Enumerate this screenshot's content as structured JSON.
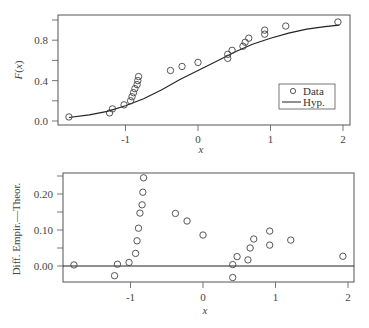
{
  "chart_data": [
    {
      "type": "scatter+line",
      "title": "",
      "xlabel": "x",
      "ylabel": "F(x)",
      "xlim": [
        -1.85,
        2.1
      ],
      "ylim": [
        -0.03,
        1.05
      ],
      "xticks": [
        -1,
        0,
        1,
        2
      ],
      "xtick_labels": [
        "-1",
        "0",
        "1",
        "2"
      ],
      "yticks": [
        0.0,
        0.2,
        0.4,
        0.6,
        0.8,
        1.0
      ],
      "ytick_labels": [
        "0.0",
        "",
        "0.4",
        "",
        "0.8",
        ""
      ],
      "grid": false,
      "legend": {
        "position": "lower right",
        "entries": [
          "Data",
          "Hyp."
        ]
      },
      "series": [
        {
          "name": "Data",
          "kind": "scatter",
          "marker": "open-circle",
          "x": [
            -1.78,
            -1.22,
            -1.18,
            -1.02,
            -0.93,
            -0.91,
            -0.89,
            -0.87,
            -0.84,
            -0.83,
            -0.82,
            -0.38,
            -0.22,
            0.0,
            0.41,
            0.41,
            0.47,
            0.62,
            0.65,
            0.7,
            0.92,
            0.92,
            1.21,
            1.93
          ],
          "y": [
            0.04,
            0.08,
            0.12,
            0.16,
            0.2,
            0.24,
            0.28,
            0.32,
            0.36,
            0.4,
            0.44,
            0.5,
            0.54,
            0.58,
            0.62,
            0.66,
            0.7,
            0.74,
            0.78,
            0.82,
            0.86,
            0.9,
            0.94,
            0.98
          ]
        },
        {
          "name": "Hyp.",
          "kind": "line",
          "x": [
            -1.78,
            -1.5,
            -1.25,
            -1.0,
            -0.75,
            -0.5,
            -0.25,
            0.0,
            0.25,
            0.5,
            0.75,
            1.0,
            1.25,
            1.5,
            1.75,
            1.95
          ],
          "y": [
            0.035,
            0.06,
            0.095,
            0.15,
            0.22,
            0.31,
            0.41,
            0.5,
            0.59,
            0.68,
            0.76,
            0.82,
            0.87,
            0.91,
            0.935,
            0.95
          ]
        }
      ]
    },
    {
      "type": "scatter",
      "title": "",
      "xlabel": "x",
      "ylabel": "Diff. Empir.—Theor.",
      "xlim": [
        -1.85,
        2.1
      ],
      "ylim": [
        -0.045,
        0.26
      ],
      "xticks": [
        -1,
        0,
        1,
        2
      ],
      "xtick_labels": [
        "-1",
        "0",
        "1",
        "2"
      ],
      "yticks": [
        0.0,
        0.05,
        0.1,
        0.15,
        0.2,
        0.25
      ],
      "ytick_labels": [
        "0.00",
        "",
        "0.10",
        "",
        "0.20",
        ""
      ],
      "grid": false,
      "reference_line": 0.0,
      "series": [
        {
          "name": "Difference",
          "marker": "open-circle",
          "x": [
            -1.78,
            -1.22,
            -1.18,
            -1.02,
            -0.93,
            -0.91,
            -0.89,
            -0.87,
            -0.84,
            -0.83,
            -0.82,
            -0.38,
            -0.22,
            0.0,
            0.41,
            0.41,
            0.47,
            0.62,
            0.65,
            0.7,
            0.92,
            0.92,
            1.21,
            1.93
          ],
          "y": [
            0.003,
            -0.027,
            0.005,
            0.01,
            0.035,
            0.07,
            0.105,
            0.147,
            0.17,
            0.205,
            0.245,
            0.146,
            0.125,
            0.086,
            -0.032,
            0.004,
            0.026,
            0.017,
            0.05,
            0.075,
            0.058,
            0.097,
            0.072,
            0.027
          ]
        }
      ]
    }
  ],
  "labels": {
    "top_ylabel_main": "F",
    "top_ylabel_open": "(",
    "top_ylabel_var": "x",
    "top_ylabel_close": ")",
    "top_xlabel": "x",
    "bottom_ylabel": "Diff. Empir.—Theor.",
    "bottom_xlabel": "x",
    "legend_data": "Data",
    "legend_hyp": "Hyp."
  }
}
